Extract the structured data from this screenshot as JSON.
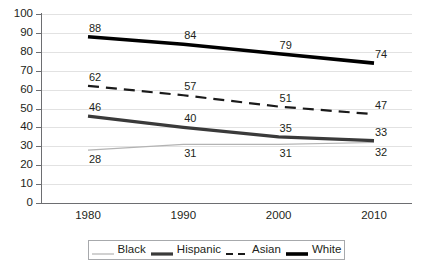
{
  "chart_data": {
    "type": "line",
    "title": "",
    "subtitle": "",
    "xlabel": "",
    "ylabel": "",
    "categories": [
      "1980",
      "1990",
      "2000",
      "2010"
    ],
    "x": [
      1980,
      1990,
      2000,
      2010
    ],
    "ylim": [
      0,
      100
    ],
    "ytick_step": 10,
    "yticks": [
      "100",
      "90",
      "80",
      "70",
      "60",
      "50",
      "40",
      "30",
      "20",
      "10",
      "0"
    ],
    "grid": "horizontal",
    "legend_position": "bottom",
    "series": [
      {
        "name": "Black",
        "values": [
          28,
          31,
          31,
          32
        ],
        "color": "#b3b3b3",
        "style": "solid",
        "width": 1.2,
        "label_position": "below"
      },
      {
        "name": "Hispanic",
        "values": [
          46,
          40,
          35,
          33
        ],
        "color": "#3a3a3a",
        "style": "solid",
        "width": 3.2,
        "label_position": "above"
      },
      {
        "name": "Asian",
        "values": [
          62,
          57,
          51,
          47
        ],
        "color": "#1a1a1a",
        "style": "dashed",
        "width": 2.2,
        "label_position": "above"
      },
      {
        "name": "White",
        "values": [
          88,
          84,
          79,
          74
        ],
        "color": "#000000",
        "style": "solid",
        "width": 3.6,
        "label_position": "above"
      }
    ],
    "data_labels": {
      "Black": [
        "28",
        "31",
        "31",
        "32"
      ],
      "Hispanic": [
        "46",
        "40",
        "35",
        "33"
      ],
      "Asian": [
        "62",
        "57",
        "51",
        "47"
      ],
      "White": [
        "88",
        "84",
        "79",
        "74"
      ]
    }
  },
  "legend": {
    "items": [
      {
        "label": "Black"
      },
      {
        "label": "Hispanic"
      },
      {
        "label": "Asian"
      },
      {
        "label": "White"
      }
    ]
  },
  "colors": {
    "axis": "#6d6e71",
    "grid": "#e2e2e2",
    "text": "#231f20",
    "background": "#ffffff"
  }
}
